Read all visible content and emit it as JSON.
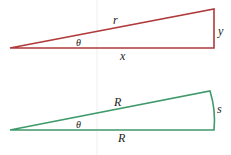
{
  "colors": {
    "triangle": "#b03a3a",
    "sector": "#3f9a6a",
    "guide": "#e6e6e6"
  },
  "triangle": {
    "hypotenuse": "r",
    "opposite": "y",
    "adjacent": "x",
    "angle": "θ"
  },
  "sector": {
    "radius_top": "R",
    "arc": "s",
    "radius_bottom": "R",
    "angle": "θ"
  }
}
